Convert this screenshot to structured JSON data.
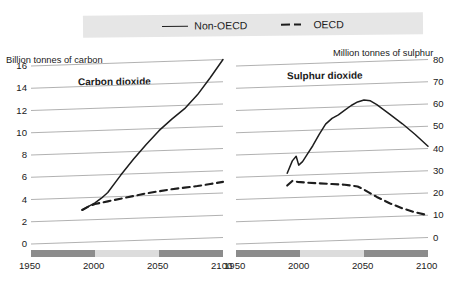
{
  "legend": {
    "items": [
      {
        "label": "Non-OECD",
        "style": "solid",
        "icon": "solid-line-icon"
      },
      {
        "label": "OECD",
        "style": "dashed",
        "icon": "dashed-line-icon"
      }
    ]
  },
  "colors": {
    "line": "#1d1d1d",
    "grid": "#a8a8a8",
    "legend_background": "#e6e6e6",
    "band_dark": "#8c8c8c",
    "band_light": "#dcdcdc"
  },
  "band": {
    "segments": [
      {
        "from": 1950,
        "to": 2000,
        "shade": "dark"
      },
      {
        "from": 2000,
        "to": 2050,
        "shade": "light"
      },
      {
        "from": 2050,
        "to": 2100,
        "shade": "dark"
      }
    ]
  },
  "chart_data": [
    {
      "type": "line",
      "title": "Carbon dioxide",
      "ylabel": "Billion tonnes of carbon",
      "xlabel": "",
      "xlim": [
        1950,
        2100
      ],
      "ylim": [
        0,
        16
      ],
      "xticks": [
        1950,
        2000,
        2050,
        2100
      ],
      "yticks": [
        0,
        2,
        4,
        6,
        8,
        10,
        12,
        14,
        16
      ],
      "grid": true,
      "legend_position": "top-center",
      "series": [
        {
          "name": "Non-OECD",
          "style": "solid",
          "x": [
            1990,
            1995,
            2000,
            2005,
            2010,
            2020,
            2030,
            2040,
            2050,
            2060,
            2070,
            2080,
            2090,
            2100
          ],
          "y": [
            2.9,
            3.2,
            3.5,
            3.9,
            4.4,
            5.9,
            7.3,
            8.6,
            9.8,
            10.8,
            11.7,
            12.9,
            14.4,
            16.0
          ]
        },
        {
          "name": "OECD",
          "style": "dashed",
          "x": [
            1990,
            1995,
            2000,
            2010,
            2020,
            2030,
            2040,
            2050,
            2060,
            2070,
            2080,
            2090,
            2100
          ],
          "y": [
            2.9,
            3.2,
            3.4,
            3.6,
            3.8,
            4.0,
            4.2,
            4.35,
            4.5,
            4.6,
            4.7,
            4.85,
            5.0
          ]
        }
      ]
    },
    {
      "type": "line",
      "title": "Sulphur dioxide",
      "ylabel": "Million tonnes of sulphur",
      "xlabel": "",
      "xlim": [
        1950,
        2100
      ],
      "ylim": [
        0,
        80
      ],
      "xticks": [
        1950,
        2000,
        2050,
        2100
      ],
      "yticks": [
        0,
        10,
        20,
        30,
        40,
        50,
        60,
        70,
        80
      ],
      "grid": true,
      "legend_position": "top-center",
      "series": [
        {
          "name": "Non-OECD",
          "style": "solid",
          "x": [
            1990,
            1994,
            1997,
            1999,
            2002,
            2006,
            2010,
            2015,
            2020,
            2025,
            2030,
            2035,
            2040,
            2045,
            2050,
            2055,
            2060,
            2070,
            2080,
            2090,
            2100
          ],
          "y": [
            31.0,
            36.5,
            38.5,
            34.5,
            36.0,
            39.5,
            43.0,
            48.0,
            52.5,
            55.0,
            56.5,
            58.5,
            60.5,
            62.0,
            62.8,
            62.3,
            60.5,
            56.0,
            51.5,
            46.5,
            41.0
          ]
        },
        {
          "name": "OECD",
          "style": "dashed",
          "x": [
            1990,
            1994,
            1998,
            2005,
            2015,
            2025,
            2035,
            2045,
            2050,
            2060,
            2070,
            2080,
            2090,
            2100
          ],
          "y": [
            25.5,
            27.5,
            27.0,
            26.5,
            26.0,
            25.5,
            25.0,
            24.0,
            22.5,
            19.0,
            16.0,
            13.5,
            11.5,
            10.0
          ]
        }
      ]
    }
  ]
}
